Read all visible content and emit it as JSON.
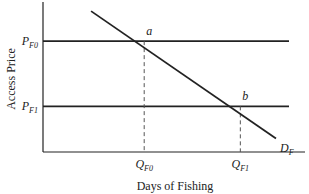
{
  "chart_data": {
    "type": "line",
    "title": "",
    "xlabel": "Days of Fishing",
    "ylabel": "Access Price",
    "grid": false,
    "price_levels": [
      {
        "name": "P_F0",
        "label_main": "P",
        "label_sub": "F0",
        "value": 0.85
      },
      {
        "name": "P_F1",
        "label_main": "P",
        "label_sub": "F1",
        "value": 0.35
      }
    ],
    "quantity_levels": [
      {
        "name": "Q_F0",
        "label_main": "Q",
        "label_sub": "F0",
        "value": 0.4
      },
      {
        "name": "Q_F1",
        "label_main": "Q",
        "label_sub": "F1",
        "value": 0.78
      }
    ],
    "demand_curve": {
      "label_main": "D",
      "label_sub": "F",
      "points": [
        [
          0.19,
          1.08
        ],
        [
          1.0,
          0.08
        ]
      ]
    },
    "points": [
      {
        "label": "a",
        "x": 0.4,
        "y": 0.85
      },
      {
        "label": "b",
        "x": 0.78,
        "y": 0.35
      }
    ],
    "xlim": [
      0,
      1.0
    ],
    "ylim": [
      0,
      1.15
    ]
  }
}
